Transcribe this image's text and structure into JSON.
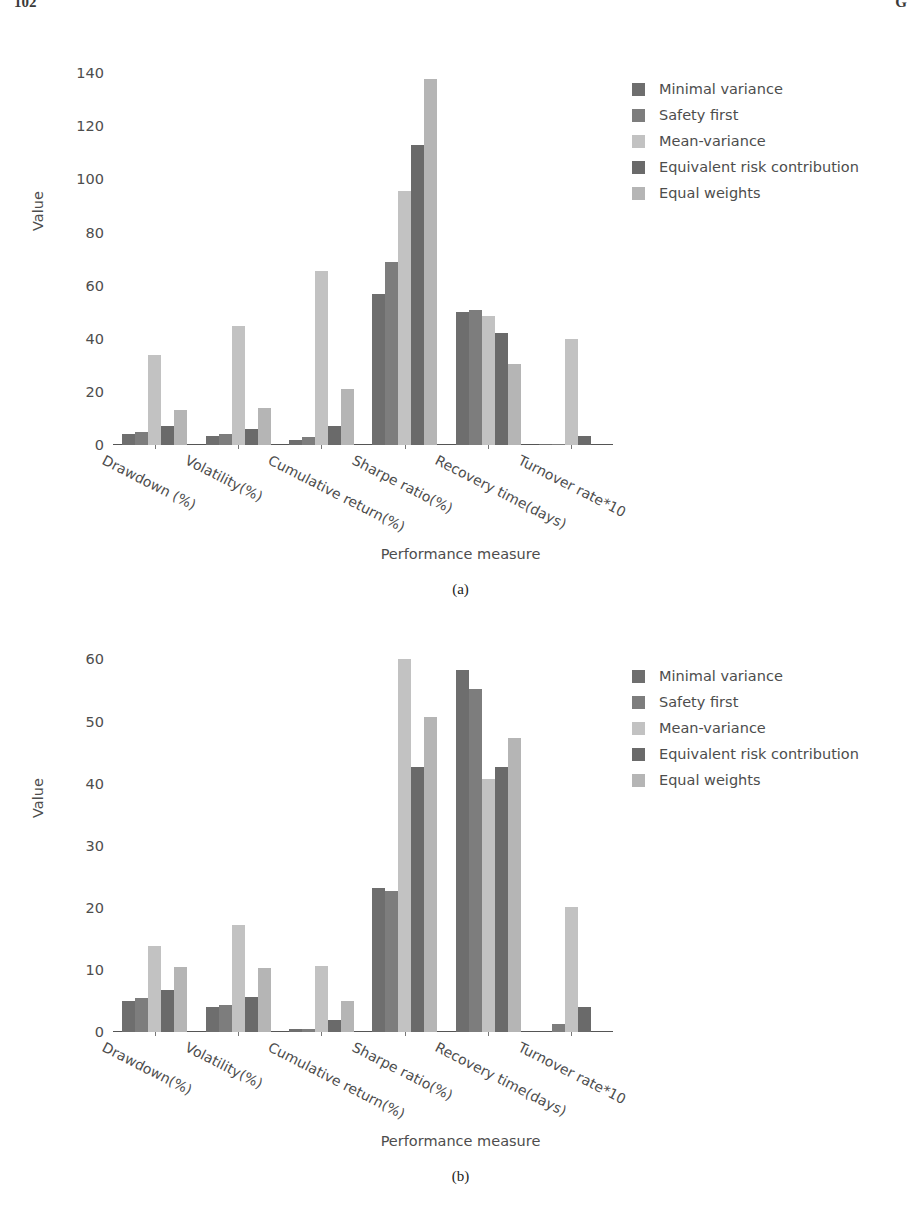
{
  "page": {
    "number_left": "102",
    "number_right": "G"
  },
  "legend": {
    "entries": [
      {
        "label": "Minimal variance",
        "color": "#6e6e6e"
      },
      {
        "label": "Safety first",
        "color": "#7d7d7d"
      },
      {
        "label": "Mean-variance",
        "color": "#c2c2c2"
      },
      {
        "label": "Equivalent risk contribution",
        "color": "#6a6a6a"
      },
      {
        "label": "Equal weights",
        "color": "#b5b5b5"
      }
    ]
  },
  "figures": [
    {
      "caption": "(a)",
      "chart_data": {
        "type": "bar",
        "title": "",
        "xlabel": "Performance measure",
        "ylabel": "Value",
        "ylim": [
          0,
          145
        ],
        "yticks": [
          0,
          20,
          40,
          60,
          80,
          100,
          120,
          140
        ],
        "grid": false,
        "legend_position": "right",
        "categories": [
          "Drawdown (%)",
          "Volatility(%)",
          "Cumulative return(%)",
          "Sharpe ratio(%)",
          "Recovery time(days)",
          "Turnover rate*10"
        ],
        "series": [
          {
            "name": "Minimal variance",
            "color": "#6e6e6e",
            "values": [
              4.0,
              3.5,
              2.0,
              57.0,
              50.0,
              0.3
            ]
          },
          {
            "name": "Safety first",
            "color": "#7d7d7d",
            "values": [
              5.0,
              4.0,
              3.0,
              69.0,
              51.0,
              0.5
            ]
          },
          {
            "name": "Mean-variance",
            "color": "#c2c2c2",
            "values": [
              34.0,
              45.0,
              65.5,
              95.5,
              48.5,
              40.0
            ]
          },
          {
            "name": "Equivalent risk contribution",
            "color": "#6a6a6a",
            "values": [
              7.0,
              6.0,
              7.0,
              113.0,
              42.0,
              3.5
            ]
          },
          {
            "name": "Equal weights",
            "color": "#b5b5b5",
            "values": [
              13.0,
              14.0,
              21.0,
              138.0,
              30.5,
              0.0
            ]
          }
        ]
      }
    },
    {
      "caption": "(b)",
      "chart_data": {
        "type": "bar",
        "title": "",
        "xlabel": "Performance measure",
        "ylabel": "Value",
        "ylim": [
          0,
          62
        ],
        "yticks": [
          0,
          10,
          20,
          30,
          40,
          50,
          60
        ],
        "grid": false,
        "legend_position": "right",
        "categories": [
          "Drawdown(%)",
          "Volatility(%)",
          "Cumulative return(%)",
          "Sharpe ratio(%)",
          "Recovery time(days)",
          "Turnover rate*10"
        ],
        "series": [
          {
            "name": "Minimal variance",
            "color": "#6e6e6e",
            "values": [
              5.0,
              4.0,
              0.5,
              23.2,
              58.3,
              0.0
            ]
          },
          {
            "name": "Safety first",
            "color": "#7d7d7d",
            "values": [
              5.5,
              4.3,
              0.5,
              22.7,
              55.3,
              1.3
            ]
          },
          {
            "name": "Mean-variance",
            "color": "#c2c2c2",
            "values": [
              13.8,
              17.2,
              10.6,
              60.0,
              40.7,
              20.2
            ]
          },
          {
            "name": "Equivalent risk contribution",
            "color": "#6a6a6a",
            "values": [
              6.8,
              5.7,
              2.0,
              42.7,
              42.6,
              4.0
            ]
          },
          {
            "name": "Equal weights",
            "color": "#b5b5b5",
            "values": [
              10.4,
              10.3,
              5.0,
              50.8,
              47.4,
              0.0
            ]
          }
        ]
      }
    }
  ]
}
